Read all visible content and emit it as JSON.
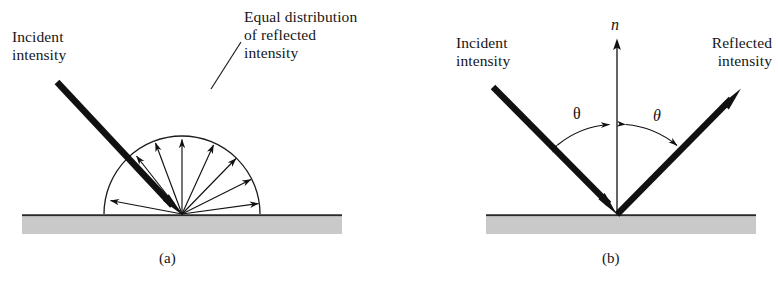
{
  "figure": {
    "type": "optics-reflection-diagram",
    "panels": [
      {
        "id": "a",
        "caption": "(a)",
        "description": "diffuse reflection: equal distribution of reflected intensity over a hemisphere",
        "labels": {
          "incident": "Incident\nintensity",
          "distribution_line1": "Equal distribution",
          "distribution_line2": "of reflected",
          "distribution_line3": "intensity"
        }
      },
      {
        "id": "b",
        "caption": "(b)",
        "description": "specular reflection: angle of incidence equals angle of reflection about the surface normal",
        "labels": {
          "normal": "n",
          "incident": "Incident\nintensity",
          "reflected": "Reflected\nintensity",
          "theta_left": "θ",
          "theta_right": "θ"
        }
      }
    ],
    "colors": {
      "ink": "#111111",
      "surface_fill": "#c9c9c9",
      "surface_line": "#2a2a2a",
      "background": "#ffffff"
    }
  }
}
